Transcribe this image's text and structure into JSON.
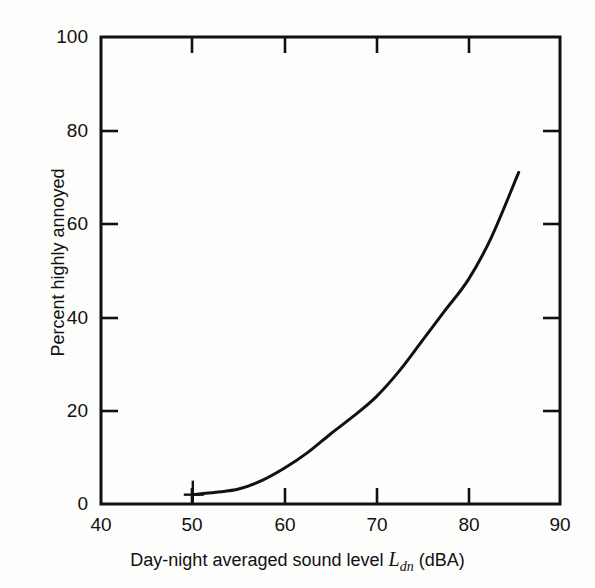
{
  "figure": {
    "background_color": "#fdfdfb",
    "ink_color": "#111111"
  },
  "axes": {
    "x_title_prefix": "Day-night averaged sound level ",
    "x_title_symbol": "L",
    "x_title_subscript": "dn",
    "x_title_suffix": " (dBA)",
    "y_title": "Percent highly annoyed",
    "x_ticks": [
      "40",
      "50",
      "60",
      "70",
      "80",
      "90"
    ],
    "y_ticks": [
      "0",
      "20",
      "40",
      "60",
      "80",
      "100"
    ]
  },
  "chart_data": {
    "type": "line",
    "title": "",
    "subtitle": "",
    "xlabel": "Day-night averaged sound level Ldn (dBA)",
    "ylabel": "Percent highly annoyed",
    "xlim": [
      40,
      90
    ],
    "ylim": [
      0,
      100
    ],
    "xticks": [
      40,
      50,
      60,
      70,
      80,
      90
    ],
    "yticks": [
      0,
      20,
      40,
      60,
      80,
      100
    ],
    "grid": false,
    "legend": "none",
    "annotations": [
      {
        "type": "marker",
        "shape": "plus",
        "x": 50,
        "y": 2,
        "note": "small cross marker at curve start"
      }
    ],
    "series": [
      {
        "name": "Percent highly annoyed",
        "color": "#111111",
        "line_width": 3,
        "x": [
          50,
          52.5,
          55,
          57.5,
          60,
          62.5,
          65,
          67.5,
          70,
          72.5,
          75,
          77.5,
          80,
          82.5,
          85.5
        ],
        "values": [
          2,
          2.5,
          3.2,
          5,
          7.7,
          11,
          15,
          18.8,
          23,
          28.5,
          35,
          41.5,
          48,
          57,
          71
        ]
      }
    ]
  }
}
